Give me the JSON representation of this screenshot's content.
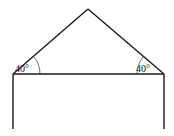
{
  "diagram": {
    "apex": {
      "x": 88,
      "y": 9
    },
    "left_base": {
      "x": 13,
      "y": 74
    },
    "right_base": {
      "x": 164,
      "y": 74
    },
    "wall_bottom_y": 129,
    "angles": {
      "left": {
        "label": "40°",
        "value": 40
      },
      "right": {
        "label": "40°",
        "value": 40
      }
    },
    "colors": {
      "line": "#1a1a1a",
      "background": "#ffffff"
    }
  }
}
